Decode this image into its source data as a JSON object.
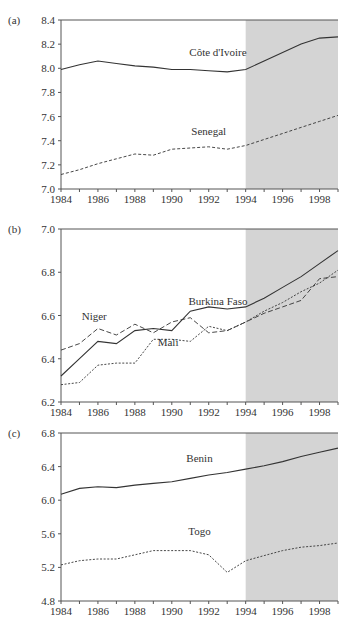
{
  "chart_data": [
    {
      "panel_label": "(a)",
      "type": "line",
      "title": "",
      "xlabel": "",
      "ylabel": "",
      "x": [
        1984,
        1985,
        1986,
        1987,
        1988,
        1989,
        1990,
        1991,
        1992,
        1993,
        1994,
        1995,
        1996,
        1997,
        1998,
        1999
      ],
      "xticks": [
        "1984",
        "1986",
        "1988",
        "1990",
        "1992",
        "1994",
        "1996",
        "1998"
      ],
      "yticks": [
        "7.0",
        "7.2",
        "7.4",
        "7.6",
        "7.8",
        "8.0",
        "8.2",
        "8.4"
      ],
      "ylim": [
        7.0,
        8.4
      ],
      "xlim": [
        1984,
        1999
      ],
      "shaded_region": [
        1994,
        1999
      ],
      "series": [
        {
          "name": "Côte d'Ivoire",
          "style": "solid",
          "values": [
            7.99,
            8.03,
            8.06,
            8.04,
            8.02,
            8.01,
            7.99,
            7.99,
            7.98,
            7.97,
            7.99,
            8.06,
            8.13,
            8.2,
            8.25,
            8.26
          ],
          "label_pos": [
            1992.5,
            8.1
          ]
        },
        {
          "name": "Senegal",
          "style": "dashed",
          "values": [
            7.12,
            7.16,
            7.21,
            7.25,
            7.29,
            7.28,
            7.33,
            7.34,
            7.35,
            7.33,
            7.36,
            7.41,
            7.46,
            7.51,
            7.56,
            7.61
          ],
          "label_pos": [
            1992.0,
            7.45
          ]
        }
      ]
    },
    {
      "panel_label": "(b)",
      "type": "line",
      "title": "",
      "xlabel": "",
      "ylabel": "",
      "x": [
        1984,
        1985,
        1986,
        1987,
        1988,
        1989,
        1990,
        1991,
        1992,
        1993,
        1994,
        1995,
        1996,
        1997,
        1998,
        1999
      ],
      "xticks": [
        "1984",
        "1986",
        "1988",
        "1990",
        "1992",
        "1994",
        "1996",
        "1998"
      ],
      "yticks": [
        "6.2",
        "6.4",
        "6.6",
        "6.8",
        "7.0"
      ],
      "ylim": [
        6.2,
        7.0
      ],
      "xlim": [
        1984,
        1999
      ],
      "shaded_region": [
        1994,
        1999
      ],
      "series": [
        {
          "name": "Burkina Faso",
          "style": "solid",
          "values": [
            6.32,
            6.4,
            6.48,
            6.47,
            6.53,
            6.54,
            6.53,
            6.62,
            6.64,
            6.63,
            6.64,
            6.68,
            6.73,
            6.78,
            6.84,
            6.9
          ],
          "label_pos": [
            1992.5,
            6.65
          ]
        },
        {
          "name": "Niger",
          "style": "longdash",
          "values": [
            6.44,
            6.47,
            6.54,
            6.51,
            6.56,
            6.52,
            6.57,
            6.59,
            6.52,
            6.53,
            6.57,
            6.61,
            6.64,
            6.67,
            6.77,
            6.78
          ],
          "label_pos": [
            1985.8,
            6.58
          ]
        },
        {
          "name": "Mali",
          "style": "dotted",
          "values": [
            6.28,
            6.29,
            6.37,
            6.38,
            6.38,
            6.49,
            6.49,
            6.48,
            6.55,
            6.53,
            6.57,
            6.62,
            6.66,
            6.71,
            6.75,
            6.81
          ],
          "label_pos": [
            1989.8,
            6.46
          ]
        }
      ]
    },
    {
      "panel_label": "(c)",
      "type": "line",
      "title": "",
      "xlabel": "",
      "ylabel": "",
      "x": [
        1984,
        1985,
        1986,
        1987,
        1988,
        1989,
        1990,
        1991,
        1992,
        1993,
        1994,
        1995,
        1996,
        1997,
        1998,
        1999
      ],
      "xticks": [
        "1984",
        "1986",
        "1988",
        "1990",
        "1992",
        "1994",
        "1996",
        "1998"
      ],
      "yticks": [
        "4.8",
        "5.2",
        "5.6",
        "6.0",
        "6.4",
        "6.8"
      ],
      "ylim": [
        4.8,
        6.8
      ],
      "xlim": [
        1984,
        1999
      ],
      "shaded_region": [
        1994,
        1999
      ],
      "series": [
        {
          "name": "Benin",
          "style": "solid",
          "values": [
            6.07,
            6.14,
            6.16,
            6.15,
            6.18,
            6.2,
            6.22,
            6.26,
            6.3,
            6.33,
            6.37,
            6.41,
            6.46,
            6.52,
            6.57,
            6.62
          ],
          "label_pos": [
            1991.5,
            6.45
          ]
        },
        {
          "name": "Togo",
          "style": "dotted",
          "values": [
            5.23,
            5.28,
            5.3,
            5.3,
            5.35,
            5.4,
            5.4,
            5.4,
            5.35,
            5.14,
            5.28,
            5.34,
            5.4,
            5.44,
            5.46,
            5.49
          ],
          "label_pos": [
            1991.5,
            5.58
          ]
        }
      ]
    }
  ],
  "panels_layout": [
    {
      "left": 61,
      "right": 338,
      "top": 20,
      "bottom": 189
    },
    {
      "left": 61,
      "right": 338,
      "top": 229,
      "bottom": 402
    },
    {
      "left": 61,
      "right": 338,
      "top": 433,
      "bottom": 601
    }
  ],
  "colors": {
    "shade": "#d4d4d4",
    "line": "#333333",
    "axis": "#555555"
  }
}
